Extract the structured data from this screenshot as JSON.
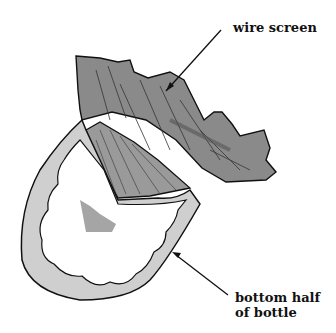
{
  "labels": {
    "wire_screen": "wire screen",
    "bottom_half_line1": "bottom half",
    "bottom_half_line2": "of bottle"
  }
}
